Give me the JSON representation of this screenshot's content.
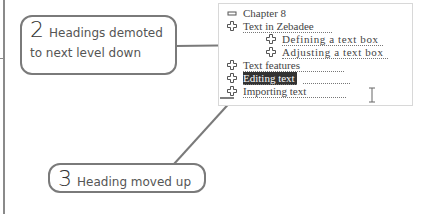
{
  "callouts": [
    {
      "number": "2",
      "text_line1": "Headings demoted",
      "text_line2": "to next level down"
    },
    {
      "number": "3",
      "text": "Heading moved up"
    }
  ],
  "outline": {
    "items": [
      {
        "label": "Chapter 8",
        "icon": "minus-icon",
        "level": 0,
        "selected": false
      },
      {
        "label": "Text in Zebadee",
        "icon": "plus-icon",
        "level": 0,
        "selected": false
      },
      {
        "label": "Defining a text box",
        "icon": "plus-icon",
        "level": 1,
        "selected": false
      },
      {
        "label": "Adjusting a text box",
        "icon": "plus-icon",
        "level": 1,
        "selected": false
      },
      {
        "label": "Text features",
        "icon": "plus-icon",
        "level": 0,
        "selected": false
      },
      {
        "label": "Editing text",
        "icon": "plus-icon",
        "level": 0,
        "selected": true
      },
      {
        "label": "Importing text",
        "icon": "plus-icon",
        "level": 0,
        "selected": false
      }
    ]
  },
  "colors": {
    "selection_bg": "#333333",
    "callout_border": "#7a7a7a",
    "panel_border": "#d8d8d8"
  }
}
